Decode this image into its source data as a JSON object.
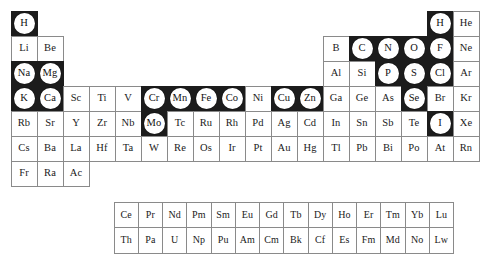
{
  "figure": {
    "name": "periodic-table-of-the-elements",
    "colors": {
      "background": "#ffffff",
      "cell_border": "#8a8a8a",
      "highlight_tile": "#1c1c1c",
      "highlight_disc": "#ffffff",
      "text": "#1a1a1a"
    },
    "legend": {
      "highlighted_meaning": "marked element",
      "plain_meaning": "unmarked element"
    }
  },
  "main_grid": {
    "columns": 18,
    "rows": [
      {
        "row": 1,
        "cells": [
          {
            "symbol": "H",
            "marked": true
          },
          {
            "symbol": "",
            "empty": true
          },
          {
            "symbol": "",
            "empty": true
          },
          {
            "symbol": "",
            "empty": true
          },
          {
            "symbol": "",
            "empty": true
          },
          {
            "symbol": "",
            "empty": true
          },
          {
            "symbol": "",
            "empty": true
          },
          {
            "symbol": "",
            "empty": true
          },
          {
            "symbol": "",
            "empty": true
          },
          {
            "symbol": "",
            "empty": true
          },
          {
            "symbol": "",
            "empty": true
          },
          {
            "symbol": "",
            "empty": true
          },
          {
            "symbol": "",
            "empty": true
          },
          {
            "symbol": "",
            "empty": true
          },
          {
            "symbol": "",
            "empty": true
          },
          {
            "symbol": "",
            "empty": true
          },
          {
            "symbol": "H",
            "marked": true
          },
          {
            "symbol": "He",
            "marked": false
          }
        ]
      },
      {
        "row": 2,
        "cells": [
          {
            "symbol": "Li",
            "marked": false
          },
          {
            "symbol": "Be",
            "marked": false
          },
          {
            "symbol": "",
            "empty": true
          },
          {
            "symbol": "",
            "empty": true
          },
          {
            "symbol": "",
            "empty": true
          },
          {
            "symbol": "",
            "empty": true
          },
          {
            "symbol": "",
            "empty": true
          },
          {
            "symbol": "",
            "empty": true
          },
          {
            "symbol": "",
            "empty": true
          },
          {
            "symbol": "",
            "empty": true
          },
          {
            "symbol": "",
            "empty": true
          },
          {
            "symbol": "",
            "empty": true
          },
          {
            "symbol": "B",
            "marked": false
          },
          {
            "symbol": "C",
            "marked": true
          },
          {
            "symbol": "N",
            "marked": true
          },
          {
            "symbol": "O",
            "marked": true
          },
          {
            "symbol": "F",
            "marked": true
          },
          {
            "symbol": "Ne",
            "marked": false
          }
        ]
      },
      {
        "row": 3,
        "cells": [
          {
            "symbol": "Na",
            "marked": true
          },
          {
            "symbol": "Mg",
            "marked": true
          },
          {
            "symbol": "",
            "empty": true
          },
          {
            "symbol": "",
            "empty": true
          },
          {
            "symbol": "",
            "empty": true
          },
          {
            "symbol": "",
            "empty": true
          },
          {
            "symbol": "",
            "empty": true
          },
          {
            "symbol": "",
            "empty": true
          },
          {
            "symbol": "",
            "empty": true
          },
          {
            "symbol": "",
            "empty": true
          },
          {
            "symbol": "",
            "empty": true
          },
          {
            "symbol": "",
            "empty": true
          },
          {
            "symbol": "Al",
            "marked": false
          },
          {
            "symbol": "Si",
            "marked": false
          },
          {
            "symbol": "P",
            "marked": true
          },
          {
            "symbol": "S",
            "marked": true
          },
          {
            "symbol": "Cl",
            "marked": true
          },
          {
            "symbol": "Ar",
            "marked": false
          }
        ]
      },
      {
        "row": 4,
        "cells": [
          {
            "symbol": "K",
            "marked": true
          },
          {
            "symbol": "Ca",
            "marked": true
          },
          {
            "symbol": "Sc",
            "marked": false
          },
          {
            "symbol": "Ti",
            "marked": false
          },
          {
            "symbol": "V",
            "marked": false
          },
          {
            "symbol": "Cr",
            "marked": true
          },
          {
            "symbol": "Mn",
            "marked": true
          },
          {
            "symbol": "Fe",
            "marked": true
          },
          {
            "symbol": "Co",
            "marked": true
          },
          {
            "symbol": "Ni",
            "marked": false
          },
          {
            "symbol": "Cu",
            "marked": true
          },
          {
            "symbol": "Zn",
            "marked": true
          },
          {
            "symbol": "Ga",
            "marked": false
          },
          {
            "symbol": "Ge",
            "marked": false
          },
          {
            "symbol": "As",
            "marked": false
          },
          {
            "symbol": "Se",
            "marked": true
          },
          {
            "symbol": "Br",
            "marked": false
          },
          {
            "symbol": "Kr",
            "marked": false
          }
        ]
      },
      {
        "row": 5,
        "cells": [
          {
            "symbol": "Rb",
            "marked": false
          },
          {
            "symbol": "Sr",
            "marked": false
          },
          {
            "symbol": "Y",
            "marked": false
          },
          {
            "symbol": "Zr",
            "marked": false
          },
          {
            "symbol": "Nb",
            "marked": false
          },
          {
            "symbol": "Mo",
            "marked": true
          },
          {
            "symbol": "Tc",
            "marked": false
          },
          {
            "symbol": "Ru",
            "marked": false
          },
          {
            "symbol": "Rh",
            "marked": false
          },
          {
            "symbol": "Pd",
            "marked": false
          },
          {
            "symbol": "Ag",
            "marked": false
          },
          {
            "symbol": "Cd",
            "marked": false
          },
          {
            "symbol": "In",
            "marked": false
          },
          {
            "symbol": "Sn",
            "marked": false
          },
          {
            "symbol": "Sb",
            "marked": false
          },
          {
            "symbol": "Te",
            "marked": false
          },
          {
            "symbol": "I",
            "marked": true
          },
          {
            "symbol": "Xe",
            "marked": false
          }
        ]
      },
      {
        "row": 6,
        "cells": [
          {
            "symbol": "Cs",
            "marked": false
          },
          {
            "symbol": "Ba",
            "marked": false
          },
          {
            "symbol": "La",
            "marked": false
          },
          {
            "symbol": "Hf",
            "marked": false
          },
          {
            "symbol": "Ta",
            "marked": false
          },
          {
            "symbol": "W",
            "marked": false
          },
          {
            "symbol": "Re",
            "marked": false
          },
          {
            "symbol": "Os",
            "marked": false
          },
          {
            "symbol": "Ir",
            "marked": false
          },
          {
            "symbol": "Pt",
            "marked": false
          },
          {
            "symbol": "Au",
            "marked": false
          },
          {
            "symbol": "Hg",
            "marked": false
          },
          {
            "symbol": "Tl",
            "marked": false
          },
          {
            "symbol": "Pb",
            "marked": false
          },
          {
            "symbol": "Bi",
            "marked": false
          },
          {
            "symbol": "Po",
            "marked": false
          },
          {
            "symbol": "At",
            "marked": false
          },
          {
            "symbol": "Rn",
            "marked": false
          }
        ]
      },
      {
        "row": 7,
        "cells": [
          {
            "symbol": "Fr",
            "marked": false
          },
          {
            "symbol": "Ra",
            "marked": false
          },
          {
            "symbol": "Ac",
            "marked": false
          },
          {
            "symbol": "",
            "empty": true
          },
          {
            "symbol": "",
            "empty": true
          },
          {
            "symbol": "",
            "empty": true
          },
          {
            "symbol": "",
            "empty": true
          },
          {
            "symbol": "",
            "empty": true
          },
          {
            "symbol": "",
            "empty": true
          },
          {
            "symbol": "",
            "empty": true
          },
          {
            "symbol": "",
            "empty": true
          },
          {
            "symbol": "",
            "empty": true
          },
          {
            "symbol": "",
            "empty": true
          },
          {
            "symbol": "",
            "empty": true
          },
          {
            "symbol": "",
            "empty": true
          },
          {
            "symbol": "",
            "empty": true
          },
          {
            "symbol": "",
            "empty": true
          },
          {
            "symbol": "",
            "empty": true
          }
        ]
      }
    ]
  },
  "fblock_grid": {
    "columns": 15,
    "rows": [
      {
        "row": "lanthanides",
        "cells": [
          {
            "symbol": "Ce",
            "marked": false
          },
          {
            "symbol": "Pr",
            "marked": false
          },
          {
            "symbol": "Nd",
            "marked": false
          },
          {
            "symbol": "Pm",
            "marked": false
          },
          {
            "symbol": "Sm",
            "marked": false
          },
          {
            "symbol": "Eu",
            "marked": false
          },
          {
            "symbol": "Gd",
            "marked": false
          },
          {
            "symbol": "Tb",
            "marked": false
          },
          {
            "symbol": "Dy",
            "marked": false
          },
          {
            "symbol": "Ho",
            "marked": false
          },
          {
            "symbol": "Er",
            "marked": false
          },
          {
            "symbol": "Tm",
            "marked": false
          },
          {
            "symbol": "Yb",
            "marked": false
          },
          {
            "symbol": "Lu",
            "marked": false
          },
          {
            "symbol": "",
            "empty": true
          }
        ]
      },
      {
        "row": "actinides",
        "cells": [
          {
            "symbol": "Th",
            "marked": false
          },
          {
            "symbol": "Pa",
            "marked": false
          },
          {
            "symbol": "U",
            "marked": false
          },
          {
            "symbol": "Np",
            "marked": false
          },
          {
            "symbol": "Pu",
            "marked": false
          },
          {
            "symbol": "Am",
            "marked": false
          },
          {
            "symbol": "Cm",
            "marked": false
          },
          {
            "symbol": "Bk",
            "marked": false
          },
          {
            "symbol": "Cf",
            "marked": false
          },
          {
            "symbol": "Es",
            "marked": false
          },
          {
            "symbol": "Fm",
            "marked": false
          },
          {
            "symbol": "Md",
            "marked": false
          },
          {
            "symbol": "No",
            "marked": false
          },
          {
            "symbol": "Lw",
            "marked": false
          },
          {
            "symbol": "",
            "empty": true
          }
        ]
      }
    ]
  }
}
